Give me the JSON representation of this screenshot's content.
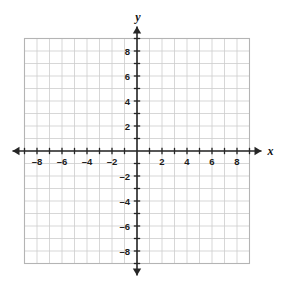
{
  "figure": {
    "kind": "coordinate-plane",
    "background_color": "#ffffff",
    "grid_color": "#cdcdcd",
    "grid_border_color": "#b4b4b4",
    "axis_color": "#262626",
    "label_color": "#1b1b1b"
  },
  "axes": {
    "x_axis_name": "x",
    "y_axis_name": "y",
    "x_range": [
      -9,
      9
    ],
    "y_range": [
      -9,
      9
    ],
    "tick_step": 1,
    "label_step": 2,
    "arrowheads": [
      "left",
      "right",
      "up",
      "down"
    ],
    "grid": true
  },
  "x_labels": [
    {
      "value": -8,
      "text": "–8"
    },
    {
      "value": -6,
      "text": "–6"
    },
    {
      "value": -4,
      "text": "–4"
    },
    {
      "value": -2,
      "text": "–2"
    },
    {
      "value": 2,
      "text": "2"
    },
    {
      "value": 4,
      "text": "4"
    },
    {
      "value": 6,
      "text": "6"
    },
    {
      "value": 8,
      "text": "8"
    }
  ],
  "y_labels": [
    {
      "value": 8,
      "text": "8"
    },
    {
      "value": 6,
      "text": "6"
    },
    {
      "value": 4,
      "text": "4"
    },
    {
      "value": 2,
      "text": "2"
    },
    {
      "value": -2,
      "text": "–2"
    },
    {
      "value": -4,
      "text": "–4"
    },
    {
      "value": -6,
      "text": "–6"
    },
    {
      "value": -8,
      "text": "–8"
    }
  ],
  "chart_data": {
    "type": "scatter",
    "title": "",
    "xlabel": "x",
    "ylabel": "y",
    "xlim": [
      -9,
      9
    ],
    "ylim": [
      -9,
      9
    ],
    "xticks": [
      -9,
      -8,
      -7,
      -6,
      -5,
      -4,
      -3,
      -2,
      -1,
      0,
      1,
      2,
      3,
      4,
      5,
      6,
      7,
      8,
      9
    ],
    "yticks": [
      -9,
      -8,
      -7,
      -6,
      -5,
      -4,
      -3,
      -2,
      -1,
      0,
      1,
      2,
      3,
      4,
      5,
      6,
      7,
      8,
      9
    ],
    "xticklabels": [
      "–8",
      "–6",
      "–4",
      "–2",
      "2",
      "4",
      "6",
      "8"
    ],
    "yticklabels": [
      "8",
      "6",
      "4",
      "2",
      "–2",
      "–4",
      "–6",
      "–8"
    ],
    "grid": true,
    "legend": false,
    "series": [
      {
        "name": "data",
        "x": [],
        "y": []
      }
    ],
    "annotations": []
  }
}
